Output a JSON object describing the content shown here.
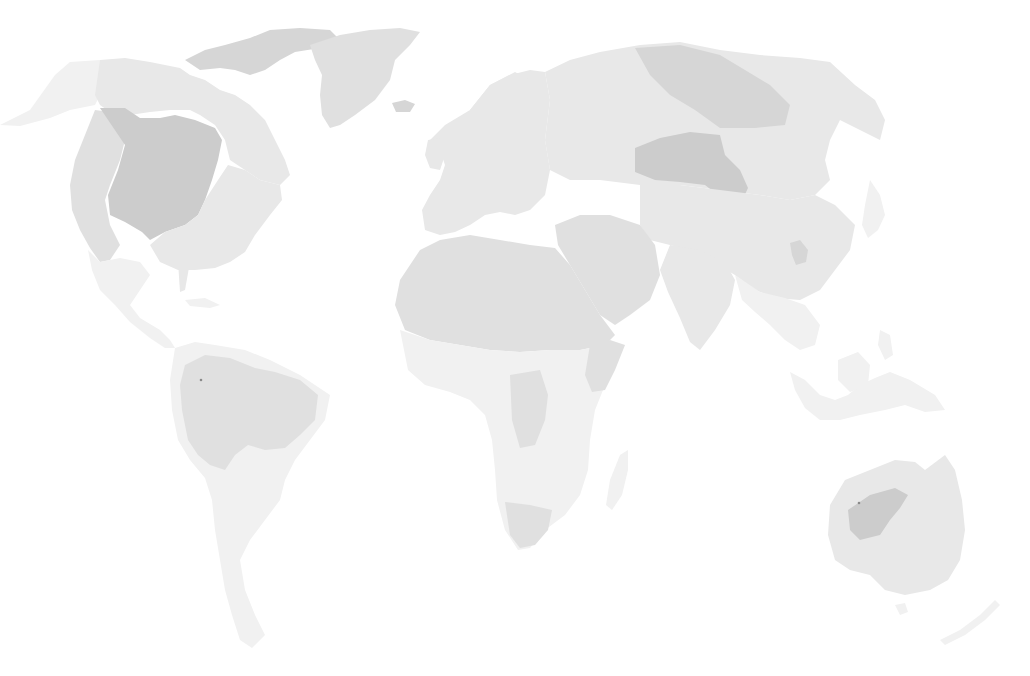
{
  "map": {
    "type": "world-choropleth",
    "projection": "pacific-cropped world map (Americas left, Asia/Australia right)",
    "background": "#ffffff",
    "legend_visible": false,
    "labels_visible": false,
    "shades": {
      "lightest": "#f1f1f1",
      "light": "#e8e8e8",
      "medium": "#e0e0e0",
      "dark": "#d6d6d6",
      "darkest": "#cccccc",
      "marker": "#8a8a8a"
    },
    "regions": [
      {
        "name": "Alaska",
        "shade": "lightest"
      },
      {
        "name": "Canada",
        "shade": "light"
      },
      {
        "name": "Canadian Arctic Archipelago",
        "shade": "dark"
      },
      {
        "name": "Greenland",
        "shade": "medium"
      },
      {
        "name": "North America interior",
        "shade": "darkest"
      },
      {
        "name": "Western US",
        "shade": "medium"
      },
      {
        "name": "Eastern US",
        "shade": "light"
      },
      {
        "name": "Mexico & Central America",
        "shade": "lightest"
      },
      {
        "name": "South America north (Amazon)",
        "shade": "medium"
      },
      {
        "name": "South America south",
        "shade": "lightest"
      },
      {
        "name": "Europe",
        "shade": "light"
      },
      {
        "name": "North Africa",
        "shade": "medium"
      },
      {
        "name": "Sub-Saharan Africa",
        "shade": "lightest"
      },
      {
        "name": "Southern Africa",
        "shade": "medium"
      },
      {
        "name": "Madagascar",
        "shade": "lightest"
      },
      {
        "name": "Middle East",
        "shade": "medium"
      },
      {
        "name": "Russia",
        "shade": "light"
      },
      {
        "name": "North Siberia",
        "shade": "dark"
      },
      {
        "name": "Central Asia (Mongolia region)",
        "shade": "darkest"
      },
      {
        "name": "China",
        "shade": "light"
      },
      {
        "name": "India",
        "shade": "light"
      },
      {
        "name": "Southeast Asia",
        "shade": "lightest"
      },
      {
        "name": "Indonesia",
        "shade": "lightest"
      },
      {
        "name": "Japan",
        "shade": "lightest"
      },
      {
        "name": "Australia",
        "shade": "light"
      },
      {
        "name": "Australia interior",
        "shade": "darkest"
      },
      {
        "name": "New Zealand",
        "shade": "lightest"
      }
    ]
  }
}
